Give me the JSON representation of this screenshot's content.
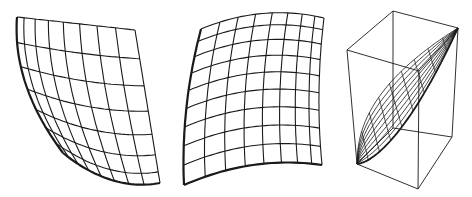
{
  "figure": {
    "background": "#ffffff",
    "stroke_color": "#1a1a1a",
    "panels": [
      {
        "id": "mesh-skewed",
        "grid": {
          "cols": 8,
          "rows": 7
        },
        "corners": {
          "tl": [
            17,
            17
          ],
          "tr": [
            135,
            30
          ],
          "br": [
            160,
            183
          ],
          "bl": [
            63,
            153
          ]
        },
        "bulge": {
          "left": [
            -14,
            0
          ],
          "bottom": [
            0,
            12
          ],
          "top": [
            0,
            0
          ],
          "right": [
            0,
            0
          ]
        },
        "col_spacing": "compressed-left",
        "row_spacing": "compressed-bottom"
      },
      {
        "id": "mesh-pillow",
        "grid": {
          "cols": 8,
          "rows": 9
        },
        "corners": {
          "tl": [
            201,
            29
          ],
          "tr": [
            324,
            18
          ],
          "br": [
            322,
            165
          ],
          "bl": [
            184,
            185
          ]
        },
        "bulge": {
          "left": [
            -6,
            0
          ],
          "bottom": [
            0,
            -10
          ],
          "top": [
            0,
            -10
          ],
          "right": [
            -4,
            0
          ]
        },
        "col_spacing": "compressed-right",
        "row_spacing": "compressed-top"
      },
      {
        "id": "mesh-3d-box",
        "box": {
          "top": [
            [
              347,
              50
            ],
            [
              393,
              11
            ],
            [
              458,
              28
            ],
            [
              419,
              71
            ]
          ],
          "bottom": [
            [
              357,
              164
            ],
            [
              393,
              128
            ],
            [
              452,
              137
            ],
            [
              418,
              189
            ]
          ]
        },
        "surface_rows": 9,
        "surface_cols": 9
      }
    ]
  }
}
